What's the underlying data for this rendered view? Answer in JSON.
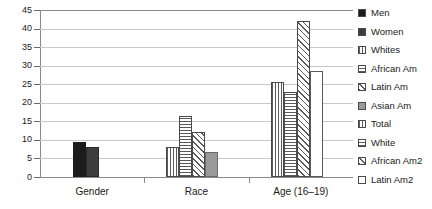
{
  "chart_data": {
    "type": "bar",
    "title": "",
    "xlabel": "",
    "ylabel": "",
    "ylim": [
      0,
      45
    ],
    "ytick_values": [
      0,
      5,
      10,
      15,
      20,
      25,
      30,
      35,
      40,
      45
    ],
    "ytick_labels": [
      "0",
      "5",
      "10",
      "15",
      "20",
      "25",
      "30",
      "35",
      "40",
      "45"
    ],
    "grid": true,
    "legend_position": "right",
    "categories": [
      "Gender",
      "Race",
      "Age (16–19)"
    ],
    "groups": [
      {
        "category": "Gender",
        "bars": [
          {
            "name": "Men",
            "value": 9.4,
            "pattern": "solid-black"
          },
          {
            "name": "Women",
            "value": 8.2,
            "pattern": "solid-dark"
          }
        ]
      },
      {
        "category": "Race",
        "bars": [
          {
            "name": "Whites",
            "value": 8.0,
            "pattern": "vertical-stripe"
          },
          {
            "name": "African Am",
            "value": 16.4,
            "pattern": "horizontal-stripe"
          },
          {
            "name": "Latin Am",
            "value": 12.0,
            "pattern": "diagonal-hatch"
          },
          {
            "name": "Asian Am",
            "value": 6.8,
            "pattern": "solid-gray"
          }
        ]
      },
      {
        "category": "Age (16–19)",
        "bars": [
          {
            "name": "Total",
            "value": 25.7,
            "pattern": "vertical-stripe"
          },
          {
            "name": "White",
            "value": 22.8,
            "pattern": "horizontal-stripe"
          },
          {
            "name": "African Am2",
            "value": 42.0,
            "pattern": "diagonal-hatch"
          },
          {
            "name": "Latin Am2",
            "value": 28.5,
            "pattern": "white-plain"
          }
        ]
      }
    ],
    "series": [
      {
        "name": "Men",
        "values": [
          9.4,
          null,
          null
        ]
      },
      {
        "name": "Women",
        "values": [
          8.2,
          null,
          null
        ]
      },
      {
        "name": "Whites",
        "values": [
          null,
          8.0,
          null
        ]
      },
      {
        "name": "African Am",
        "values": [
          null,
          16.4,
          null
        ]
      },
      {
        "name": "Latin Am",
        "values": [
          null,
          12.0,
          null
        ]
      },
      {
        "name": "Asian Am",
        "values": [
          null,
          6.8,
          null
        ]
      },
      {
        "name": "Total",
        "values": [
          null,
          null,
          25.7
        ]
      },
      {
        "name": "White",
        "values": [
          null,
          null,
          22.8
        ]
      },
      {
        "name": "African Am2",
        "values": [
          null,
          null,
          42.0
        ]
      },
      {
        "name": "Latin Am2",
        "values": [
          null,
          null,
          28.5
        ]
      }
    ]
  },
  "legend": {
    "items": [
      {
        "label": "Men",
        "pattern": "solid-black"
      },
      {
        "label": "Women",
        "pattern": "solid-dark"
      },
      {
        "label": "Whites",
        "pattern": "vertical-stripe"
      },
      {
        "label": "African Am",
        "pattern": "horizontal-stripe"
      },
      {
        "label": "Latin Am",
        "pattern": "diagonal-hatch"
      },
      {
        "label": "Asian Am",
        "pattern": "solid-gray"
      },
      {
        "label": "Total",
        "pattern": "vertical-stripe"
      },
      {
        "label": "White",
        "pattern": "horizontal-stripe"
      },
      {
        "label": "African Am2",
        "pattern": "diagonal-hatch"
      },
      {
        "label": "Latin Am2",
        "pattern": "white-plain"
      }
    ]
  },
  "colors": {
    "solid_black": "#1c1c1c",
    "solid_dark": "#3d3d3d",
    "solid_gray": "#9a9a9a",
    "gridline": "#c8c8c8",
    "axis": "#8a8a8a",
    "text": "#1a1a1a"
  }
}
